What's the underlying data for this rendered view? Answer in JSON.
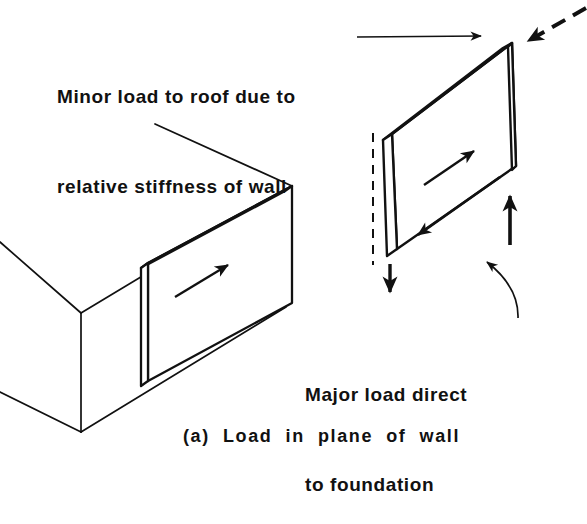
{
  "figure": {
    "caption": "(a)  Load  in  plane  of  wall",
    "caption_label": "(a)",
    "caption_text": "Load in plane of wall",
    "background_color": "#ffffff",
    "ink_color": "#111111"
  },
  "annotations": {
    "minor_load": {
      "line1": "Minor load to roof due to",
      "line2": "relative stiffness of wall",
      "leader": "straight-horizontal-arrow"
    },
    "major_load": {
      "line1": "Major load direct",
      "line2": "to foundation",
      "leader": "curved-arrow"
    }
  },
  "objects": {
    "building_box": {
      "name": "building-block",
      "description": "isometric open box representing building"
    },
    "attached_wall": {
      "name": "shear-wall-in-building",
      "arrow": "in-plane-load-arrow"
    },
    "free_wall": {
      "name": "isolated-shear-wall",
      "hidden_edges": "dashed",
      "arrows": [
        "applied-load-arrow-dashed",
        "in-plane-load-arrow",
        "base-shear-arrow",
        "vertical-reaction-down-arrow",
        "vertical-reaction-up-arrow"
      ]
    }
  },
  "force_arrows": [
    {
      "name": "applied-lateral-load",
      "style": "dashed-thick",
      "direction": "down-left"
    },
    {
      "name": "in-plane-shear",
      "style": "solid-thin",
      "direction": "up-right"
    },
    {
      "name": "base-shear-reaction",
      "style": "solid-thin",
      "direction": "down-left"
    },
    {
      "name": "uplift-reaction",
      "style": "solid-thick",
      "direction": "up"
    },
    {
      "name": "compression-reaction",
      "style": "solid-thick",
      "direction": "down"
    }
  ]
}
